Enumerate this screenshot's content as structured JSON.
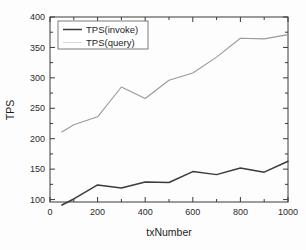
{
  "chart_data": {
    "type": "line",
    "title": "",
    "xlabel": "txNumber",
    "ylabel": "TPS",
    "xlim": [
      0,
      1000
    ],
    "ylim": [
      96,
      400
    ],
    "grid": false,
    "legend_position": "top-left",
    "xticks": [
      0,
      200,
      400,
      600,
      800,
      1000
    ],
    "xticklabels": [
      "0",
      "200",
      "400",
      "600",
      "800",
      "1000"
    ],
    "yticks": [
      100,
      150,
      200,
      250,
      300,
      350,
      400
    ],
    "yticklabels": [
      "100",
      "150",
      "200",
      "250",
      "300",
      "350",
      "400"
    ],
    "x": [
      50,
      100,
      200,
      300,
      400,
      500,
      600,
      700,
      800,
      900,
      1000
    ],
    "series": [
      {
        "name": "TPS(invoke)",
        "color": "#3b3b3b",
        "values": [
          91,
          101,
          124,
          119,
          129,
          128,
          146,
          141,
          152,
          145,
          163
        ]
      },
      {
        "name": "TPS(query)",
        "color": "#9a9a9a",
        "values": [
          211,
          223,
          236,
          285,
          266,
          296,
          308,
          334,
          365,
          364,
          371
        ]
      }
    ]
  },
  "legend": {
    "entries": [
      {
        "label": "TPS(invoke)"
      },
      {
        "label": "TPS(query)"
      }
    ]
  },
  "axes": {
    "x_title": "txNumber",
    "y_title": "TPS"
  }
}
